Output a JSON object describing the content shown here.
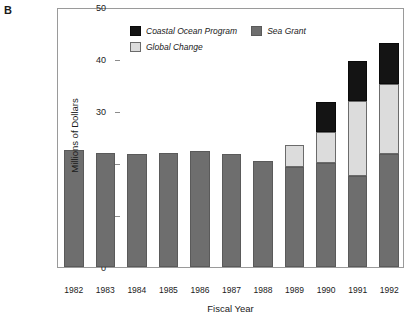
{
  "panel": {
    "letter": "B"
  },
  "chart_data": {
    "type": "bar",
    "stacked": true,
    "title": "",
    "subtitle": "",
    "xlabel": "Fiscal Year",
    "ylabel": "Millions of Dollars",
    "categories": [
      "1982",
      "1983",
      "1984",
      "1985",
      "1986",
      "1987",
      "1988",
      "1989",
      "1990",
      "1991",
      "1992"
    ],
    "ylim": [
      0,
      50
    ],
    "yticks": [
      0,
      10,
      20,
      30,
      40,
      50
    ],
    "ytick_labels": [
      "0",
      "10",
      "20",
      "30",
      "40",
      "50"
    ],
    "grid": false,
    "legend_position": "top-left-inside",
    "series": [
      {
        "name": "Sea Grant",
        "color": "#6e6e6e",
        "values": [
          22.5,
          22.0,
          21.8,
          22.0,
          22.3,
          21.8,
          20.4,
          19.2,
          20.0,
          17.5,
          21.7
        ]
      },
      {
        "name": "Global Change",
        "color": "#dcdcdc",
        "values": [
          0,
          0,
          0,
          0,
          0,
          0,
          0,
          4.3,
          6.0,
          14.5,
          13.5
        ]
      },
      {
        "name": "Coastal Ocean Program",
        "color": "#141414",
        "values": [
          0,
          0,
          0,
          0,
          0,
          0,
          0,
          0,
          5.8,
          7.6,
          7.8
        ]
      }
    ],
    "totals": [
      22.5,
      22.0,
      21.8,
      22.0,
      22.3,
      21.8,
      20.4,
      23.5,
      31.8,
      39.6,
      43.0
    ]
  },
  "legend": {
    "items": [
      {
        "label": "Coastal Ocean Program",
        "color": "#141414"
      },
      {
        "label": "Sea Grant",
        "color": "#6e6e6e"
      },
      {
        "label": "Global Change",
        "color": "#dcdcdc"
      }
    ]
  }
}
